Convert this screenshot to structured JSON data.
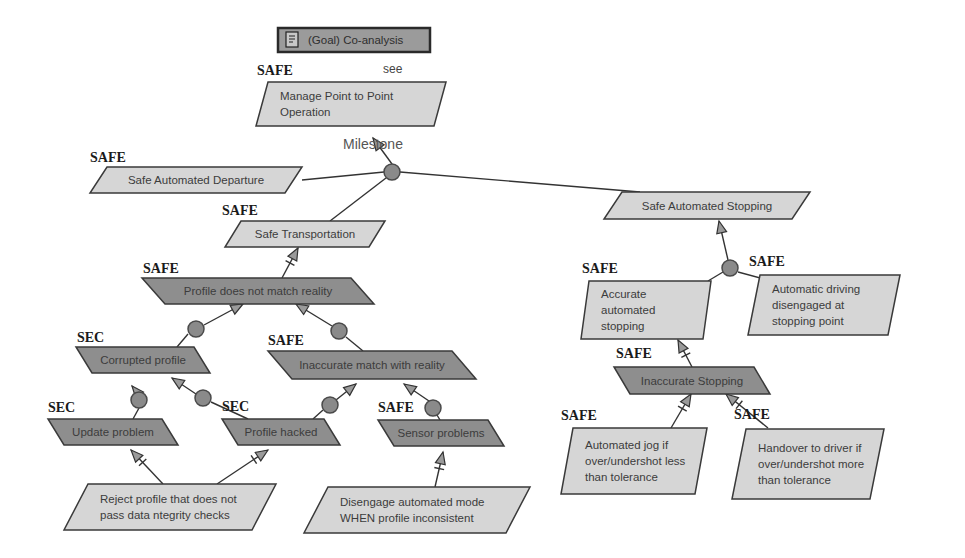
{
  "header": {
    "title": "(Goal) Co-analysis",
    "icon": "document-icon",
    "x": 278,
    "y": 28,
    "w": 152,
    "h": 24
  },
  "see_label": {
    "text": "see",
    "x": 383,
    "y": 73
  },
  "milestone_label": {
    "text": "Milestone",
    "x": 343,
    "y": 149
  },
  "colors": {
    "goal_fill": "#d6d6d6",
    "obstacle_fill": "#8e8e8e",
    "stroke": "#3a3a3a",
    "junction_fill": "#8a8a8a"
  },
  "nodes": [
    {
      "id": "manage",
      "kind": "goal",
      "tag": "SAFE",
      "tag_x": 257,
      "tag_y": 75,
      "x": 256,
      "y": 82,
      "w": 190,
      "h": 44,
      "slant": 12,
      "lines": [
        "Manage Point to Point",
        "Operation"
      ]
    },
    {
      "id": "departure",
      "kind": "goal",
      "tag": "SAFE",
      "tag_x": 90,
      "tag_y": 162,
      "x": 90,
      "y": 167,
      "w": 212,
      "h": 26,
      "slant": 17,
      "lines": [
        "Safe Automated Departure"
      ]
    },
    {
      "id": "transport",
      "kind": "goal",
      "tag": "SAFE",
      "tag_x": 222,
      "tag_y": 215,
      "x": 225,
      "y": 221,
      "w": 160,
      "h": 26,
      "slant": 16,
      "lines": [
        "Safe Transportation"
      ]
    },
    {
      "id": "stopping",
      "kind": "goal",
      "tag": "",
      "tag_x": 0,
      "tag_y": 0,
      "x": 604,
      "y": 192,
      "w": 206,
      "h": 27,
      "slant": 18,
      "lines": [
        "Safe Automated Stopping"
      ]
    },
    {
      "id": "profile_mismatch",
      "kind": "obstacle",
      "tag": "SAFE",
      "tag_x": 143,
      "tag_y": 273,
      "x": 142,
      "y": 278,
      "w": 232,
      "h": 26,
      "slant": 23,
      "lines": [
        "Profile does not match reality"
      ]
    },
    {
      "id": "corrupted",
      "kind": "obstacle",
      "tag": "SEC",
      "tag_x": 77,
      "tag_y": 342,
      "x": 76,
      "y": 347,
      "w": 134,
      "h": 26,
      "slant": 16,
      "lines": [
        "Corrupted profile"
      ]
    },
    {
      "id": "inaccurate_match",
      "kind": "obstacle",
      "tag": "SAFE",
      "tag_x": 268,
      "tag_y": 345,
      "x": 268,
      "y": 351,
      "w": 208,
      "h": 28,
      "slant": 24,
      "lines": [
        "Inaccurate match with reality"
      ]
    },
    {
      "id": "update",
      "kind": "obstacle",
      "tag": "SEC",
      "tag_x": 48,
      "tag_y": 412,
      "x": 48,
      "y": 419,
      "w": 130,
      "h": 26,
      "slant": 16,
      "lines": [
        "Update problem"
      ]
    },
    {
      "id": "hacked",
      "kind": "obstacle",
      "tag": "SEC",
      "tag_x": 222,
      "tag_y": 411,
      "x": 222,
      "y": 419,
      "w": 118,
      "h": 26,
      "slant": 16,
      "lines": [
        "Profile hacked"
      ]
    },
    {
      "id": "sensor",
      "kind": "obstacle",
      "tag": "SAFE",
      "tag_x": 378,
      "tag_y": 412,
      "x": 378,
      "y": 420,
      "w": 126,
      "h": 26,
      "slant": 16,
      "lines": [
        "Sensor problems"
      ]
    },
    {
      "id": "reject",
      "kind": "goal",
      "tag": "",
      "tag_x": 0,
      "tag_y": 0,
      "x": 64,
      "y": 484,
      "w": 212,
      "h": 46,
      "slant": 24,
      "lines": [
        "Reject profile that does not",
        "pass data ntegrity checks"
      ]
    },
    {
      "id": "disengage",
      "kind": "goal",
      "tag": "",
      "tag_x": 0,
      "tag_y": 0,
      "x": 304,
      "y": 487,
      "w": 226,
      "h": 46,
      "slant": 24,
      "lines": [
        "Disengage automated mode",
        "WHEN profile inconsistent"
      ]
    },
    {
      "id": "accurate",
      "kind": "goal",
      "tag": "SAFE",
      "tag_x": 582,
      "tag_y": 273,
      "x": 581,
      "y": 281,
      "w": 130,
      "h": 58,
      "slant": 8,
      "lines": [
        "Accurate",
        "automated",
        "stopping"
      ]
    },
    {
      "id": "auto_disengaged",
      "kind": "goal",
      "tag": "SAFE",
      "tag_x": 749,
      "tag_y": 266,
      "x": 748,
      "y": 275,
      "w": 152,
      "h": 60,
      "slant": 12,
      "lines": [
        "Automatic driving",
        "disengaged at",
        "stopping point"
      ]
    },
    {
      "id": "inaccurate_stop",
      "kind": "obstacle",
      "tag": "SAFE",
      "tag_x": 616,
      "tag_y": 358,
      "x": 614,
      "y": 367,
      "w": 156,
      "h": 27,
      "slant": 16,
      "lines": [
        "Inaccurate Stopping"
      ]
    },
    {
      "id": "jog",
      "kind": "goal",
      "tag": "SAFE",
      "tag_x": 561,
      "tag_y": 420,
      "x": 561,
      "y": 428,
      "w": 146,
      "h": 66,
      "slant": 12,
      "lines": [
        "Automated jog if",
        "over/undershot less",
        "than tolerance"
      ]
    },
    {
      "id": "handover",
      "kind": "goal",
      "tag": "SAFE",
      "tag_x": 734,
      "tag_y": 419,
      "x": 732,
      "y": 429,
      "w": 152,
      "h": 70,
      "slant": 14,
      "lines": [
        "Handover to driver if",
        "over/undershot more",
        "than tolerance"
      ]
    }
  ],
  "junctions": [
    {
      "id": "milestone_j",
      "x": 392,
      "y": 172,
      "r": 8
    },
    {
      "id": "stop_j",
      "x": 730,
      "y": 268,
      "r": 8
    },
    {
      "id": "pm_left_j",
      "x": 196,
      "y": 329,
      "r": 8
    },
    {
      "id": "pm_right_j",
      "x": 339,
      "y": 331,
      "r": 8
    },
    {
      "id": "cp_left_j",
      "x": 139,
      "y": 400,
      "r": 8
    },
    {
      "id": "cp_right_j",
      "x": 203,
      "y": 398,
      "r": 8
    },
    {
      "id": "im_left_j",
      "x": 330,
      "y": 405,
      "r": 8
    },
    {
      "id": "im_right_j",
      "x": 433,
      "y": 408,
      "r": 8
    }
  ],
  "lines": [
    {
      "from": [
        373,
        138
      ],
      "to": [
        392,
        164
      ],
      "arrow_at_from": true,
      "cross": false
    },
    {
      "from": [
        302,
        180
      ],
      "to": [
        384,
        172
      ]
    },
    {
      "from": [
        400,
        172
      ],
      "to": [
        640,
        192
      ]
    },
    {
      "from": [
        330,
        221
      ],
      "to": [
        386,
        178
      ]
    },
    {
      "from": [
        719,
        221
      ],
      "to": [
        728,
        260
      ],
      "arrow_at_from": true
    },
    {
      "from": [
        708,
        281
      ],
      "to": [
        723,
        272
      ]
    },
    {
      "from": [
        738,
        272
      ],
      "to": [
        771,
        281
      ]
    },
    {
      "from": [
        298,
        248
      ],
      "to": [
        282,
        278
      ],
      "arrow_at_from": true,
      "cross": true
    },
    {
      "from": [
        243,
        304
      ],
      "to": [
        204,
        325
      ],
      "arrow_at_from": true
    },
    {
      "from": [
        188,
        334
      ],
      "to": [
        177,
        347
      ]
    },
    {
      "from": [
        296,
        304
      ],
      "to": [
        332,
        326
      ],
      "arrow_at_from": true
    },
    {
      "from": [
        346,
        337
      ],
      "to": [
        363,
        351
      ]
    },
    {
      "from": [
        132,
        386
      ],
      "to": [
        137,
        392
      ],
      "arrow_at_from": true
    },
    {
      "from": [
        139,
        408
      ],
      "to": [
        133,
        419
      ]
    },
    {
      "from": [
        172,
        378
      ],
      "to": [
        196,
        394
      ],
      "arrow_at_from": true
    },
    {
      "from": [
        211,
        402
      ],
      "to": [
        248,
        419
      ]
    },
    {
      "from": [
        356,
        384
      ],
      "to": [
        336,
        400
      ],
      "arrow_at_from": true
    },
    {
      "from": [
        323,
        410
      ],
      "to": [
        313,
        419
      ]
    },
    {
      "from": [
        404,
        384
      ],
      "to": [
        429,
        401
      ],
      "arrow_at_from": true
    },
    {
      "from": [
        437,
        415
      ],
      "to": [
        440,
        420
      ]
    },
    {
      "from": [
        131,
        450
      ],
      "to": [
        163,
        484
      ],
      "arrow_at_from": true,
      "cross": true
    },
    {
      "from": [
        268,
        450
      ],
      "to": [
        217,
        484
      ],
      "arrow_at_from": true,
      "cross": true
    },
    {
      "from": [
        443,
        452
      ],
      "to": [
        435,
        487
      ],
      "arrow_at_from": true,
      "cross": true
    },
    {
      "from": [
        678,
        340
      ],
      "to": [
        692,
        367
      ],
      "arrow_at_from": true,
      "cross": true
    },
    {
      "from": [
        691,
        394
      ],
      "to": [
        671,
        428
      ],
      "arrow_at_from": true,
      "cross": true
    },
    {
      "from": [
        726,
        394
      ],
      "to": [
        768,
        428
      ],
      "arrow_at_from": true,
      "cross": true
    }
  ]
}
